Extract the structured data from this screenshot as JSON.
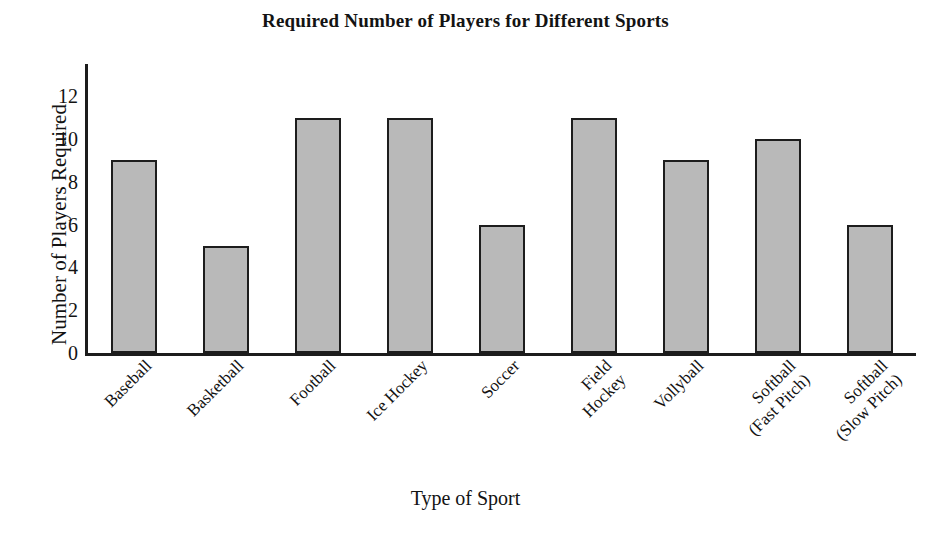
{
  "chart_data": {
    "type": "bar",
    "title": "Required Number of Players for Different Sports",
    "xlabel": "Type of Sport",
    "ylabel": "Number of Players Required",
    "categories": [
      "Baseball",
      "Basketball",
      "Football",
      "Ice Hockey",
      "Soccer",
      "Field Hockey",
      "Vollyball",
      "Softball (Fast Pitch)",
      "Softball (Slow Pitch)"
    ],
    "category_lines": [
      [
        "Baseball"
      ],
      [
        "Basketball"
      ],
      [
        "Football"
      ],
      [
        "Ice Hockey"
      ],
      [
        "Soccer"
      ],
      [
        "Field",
        "Hockey"
      ],
      [
        "Vollyball"
      ],
      [
        "Softball",
        "(Fast Pitch)"
      ],
      [
        "Softball",
        "(Slow Pitch)"
      ]
    ],
    "values": [
      9,
      5,
      11,
      11,
      6,
      11,
      9,
      10,
      6
    ],
    "ylim": [
      0,
      13.5
    ],
    "yticks": [
      0,
      2,
      4,
      6,
      8,
      10,
      12
    ],
    "ytick_labels": [
      "0",
      "2",
      "4",
      "6",
      "8",
      "10",
      "12"
    ],
    "grid": false,
    "legend": false,
    "bar_fill": "#b9b9b9",
    "bar_edge": "#1d1d1d",
    "axis_color": "#1c1c1c",
    "label_rotation": -45
  }
}
